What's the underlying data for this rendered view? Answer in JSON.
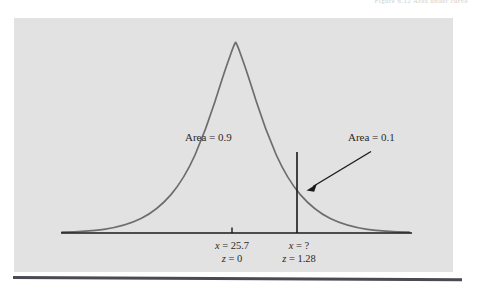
{
  "page": {
    "header_fragment": "Figure 6.12   Area under curve",
    "background_color": "#ffffff",
    "panel_color": "#e2e2e2",
    "rule_color": "#4a4a52"
  },
  "figure": {
    "curve_color": "#6d6d6d",
    "axis_color": "#1a1a1a",
    "annotation_color": "#1a1a1a",
    "area_left_label": "Area = 0.9",
    "area_right_label": "Area = 0.1",
    "mean_tick": {
      "x_label": "x = 25.7",
      "z_label": "z = 0"
    },
    "cutoff_tick": {
      "x_label": "x = ?",
      "z_label": "z = 1.28"
    }
  },
  "chart_data": {
    "type": "line",
    "title": "",
    "subtitle": "",
    "xlabel": "",
    "ylabel": "",
    "distribution": "normal",
    "mean_x": 25.7,
    "mean_z": 0,
    "cutoff_x": null,
    "cutoff_z": 1.28,
    "grid": false,
    "legend": false,
    "xlim": [
      -3.6,
      3.6
    ],
    "ylim": [
      0,
      1
    ],
    "annotations": [
      {
        "text": "Area = 0.9",
        "region": "left-of-cutoff",
        "value": 0.9,
        "z_range": [
          -3.6,
          1.28
        ]
      },
      {
        "text": "Area = 0.1",
        "region": "right-of-cutoff",
        "value": 0.1,
        "z_range": [
          1.28,
          3.6
        ],
        "has_arrow": true
      }
    ],
    "tick_labels": [
      {
        "position_z": 0,
        "lines": [
          "x = 25.7",
          "z = 0"
        ]
      },
      {
        "position_z": 1.28,
        "lines": [
          "x = ?",
          "z = 1.28"
        ]
      }
    ],
    "series": [
      {
        "name": "standard normal density",
        "x": [
          -3.6,
          -3.2,
          -2.8,
          -2.4,
          -2.0,
          -1.6,
          -1.2,
          -0.8,
          -0.4,
          0.0,
          0.4,
          0.8,
          1.2,
          1.28,
          1.6,
          2.0,
          2.4,
          2.8,
          3.2,
          3.6
        ],
        "y": [
          0.001,
          0.006,
          0.02,
          0.055,
          0.135,
          0.278,
          0.487,
          0.726,
          0.923,
          1.0,
          0.923,
          0.726,
          0.487,
          0.441,
          0.278,
          0.135,
          0.055,
          0.02,
          0.006,
          0.001
        ]
      }
    ]
  }
}
